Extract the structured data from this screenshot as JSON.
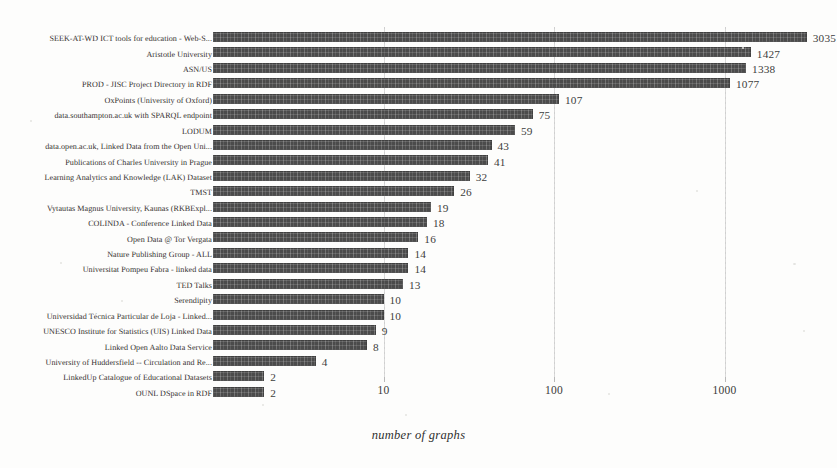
{
  "chart_data": {
    "type": "bar",
    "orientation": "horizontal",
    "title": "",
    "xlabel": "number of graphs",
    "ylabel": "",
    "xscale": "log",
    "xlim": [
      1,
      4000
    ],
    "xticks": [
      10,
      100,
      1000
    ],
    "xticklabels": [
      "10",
      "100",
      "1000"
    ],
    "grid": "vertical-dotted",
    "legend": "none",
    "bar_color": "#4b4b4b",
    "categories": [
      "SEEK-AT-WD ICT tools for education - Web-S...",
      "Aristotle University",
      "ASN/US",
      "PROD - JISC Project Directory in RDF",
      "OxPoints (University of Oxford)",
      "data.southampton.ac.uk with SPARQL endpoint",
      "LODUM",
      "data.open.ac.uk, Linked Data from the Open Uni...",
      "Publications of Charles University in Prague",
      "Learning Analytics and Knowledge (LAK) Dataset",
      "TMST",
      "Vytautas Magnus University, Kaunas (RKBExpl...",
      "COLINDA - Conference Linked Data",
      "Open Data @ Tor Vergata",
      "Nature Publishing Group - ALL",
      "Universitat Pompeu Fabra - linked data",
      "TED Talks",
      "Serendipity",
      "Universidad Técnica Particular de Loja - Linked...",
      "UNESCO Institute for Statistics (UIS) Linked Data",
      "Linked Open Aalto Data Service",
      "University of Huddersfield -- Circulation and Re...",
      "LinkedUp Catalogue of Educational Datasets",
      "OUNL DSpace in RDF"
    ],
    "values": [
      3035,
      1427,
      1338,
      1077,
      107,
      75,
      59,
      43,
      41,
      32,
      26,
      19,
      18,
      16,
      14,
      14,
      13,
      10,
      10,
      9,
      8,
      4,
      2,
      2
    ],
    "value_labels": [
      "3035",
      "1427",
      "1338",
      "1077",
      "107",
      "75",
      "59",
      "43",
      "41",
      "32",
      "26",
      "19",
      "18",
      "16",
      "14",
      "14",
      "13",
      "10",
      "10",
      "9",
      "8",
      "4",
      "2",
      "2"
    ]
  }
}
